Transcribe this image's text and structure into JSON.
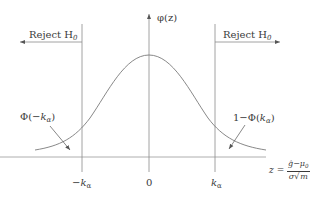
{
  "diagram": {
    "type": "normal-distribution-rejection-regions",
    "y_axis_label": "φ(z)",
    "x_axis_label": {
      "lhs": "z",
      "equals": "=",
      "numerator": "ĝ−μ",
      "numerator_sub": "0",
      "denominator_sigma": "σ",
      "denominator_root": "m"
    },
    "ticks": [
      {
        "label": "−k",
        "sub": "α"
      },
      {
        "label": "0"
      },
      {
        "label": "k",
        "sub": "α"
      }
    ],
    "regions": {
      "left": {
        "label": "Reject H",
        "sub": "0",
        "direction": "left"
      },
      "right": {
        "label": "Reject H",
        "sub": "0",
        "direction": "right"
      }
    },
    "annotations": {
      "left_tail": {
        "prefix": "Φ(−",
        "var": "k",
        "sub": "α",
        "suffix": ")"
      },
      "right_tail": {
        "prefix": "1−Φ(",
        "var": "k",
        "sub": "α",
        "suffix": ")"
      }
    },
    "colors": {
      "line": "#8a8a8a",
      "text": "#3a3a3a",
      "background": "#ffffff"
    }
  }
}
